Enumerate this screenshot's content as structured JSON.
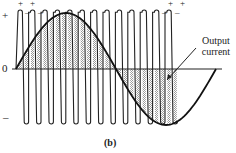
{
  "figure": {
    "caption": "(b)",
    "axis_labels": {
      "positive": "+",
      "zero": "0",
      "negative": "–"
    },
    "polarity_marks_left": [
      "+",
      "+"
    ],
    "polarity_marks_right": [
      "+",
      "+"
    ],
    "dash_marks_left": [
      "–",
      "–"
    ],
    "dash_marks_right": [
      "–",
      "–"
    ],
    "annotation": {
      "line1": "Output",
      "line2": "current"
    },
    "colors": {
      "stroke": "#222222",
      "hatch": "#9a9a9a",
      "background": "#ffffff"
    }
  },
  "waveform": {
    "type": "bipolar-pwm",
    "pulse_count": 13,
    "start_x": 16,
    "period": 12.4,
    "baseline_y": 69,
    "top_y": 10,
    "bottom_y": 124,
    "sine": {
      "x_start": 16,
      "x_end": 216,
      "amplitude": 56,
      "cycles": 1
    }
  }
}
